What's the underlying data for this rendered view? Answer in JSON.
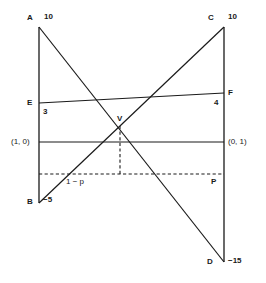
{
  "figure": {
    "type": "geometric-diagram",
    "canvas": {
      "width": 266,
      "height": 283
    },
    "colors": {
      "stroke": "#1a1a1a",
      "background": "#ffffff",
      "text": "#1a1a1a"
    }
  },
  "axes": {
    "left": {
      "x": 39,
      "y_top": 27,
      "y_bottom": 203
    },
    "right": {
      "x": 224,
      "y_top": 27,
      "y_bottom": 262
    }
  },
  "lines": [
    {
      "name": "left-axis",
      "style": "solid",
      "x1": 39,
      "y1": 27,
      "x2": 39,
      "y2": 203
    },
    {
      "name": "right-axis",
      "style": "solid",
      "x1": 224,
      "y1": 27,
      "x2": 224,
      "y2": 262
    },
    {
      "name": "diagonal-a-to-d",
      "style": "solid",
      "x1": 39,
      "y1": 27,
      "x2": 224,
      "y2": 262
    },
    {
      "name": "diagonal-b-to-c",
      "style": "solid",
      "x1": 39,
      "y1": 203,
      "x2": 224,
      "y2": 27
    },
    {
      "name": "line-e-to-f",
      "style": "solid",
      "x1": 39,
      "y1": 103,
      "x2": 224,
      "y2": 93
    },
    {
      "name": "horizontal-unit",
      "style": "solid",
      "x1": 39,
      "y1": 142,
      "x2": 224,
      "y2": 142
    },
    {
      "name": "probability-axis",
      "style": "dashed",
      "x1": 39,
      "y1": 174,
      "x2": 224,
      "y2": 174
    },
    {
      "name": "v-dropline",
      "style": "dashed",
      "x1": 120,
      "y1": 126,
      "x2": 120,
      "y2": 174
    }
  ],
  "points": {
    "A": {
      "label": "A",
      "value": "10",
      "x": 39,
      "y": 27
    },
    "B": {
      "label": "B",
      "value": "−5",
      "x": 39,
      "y": 203
    },
    "C": {
      "label": "C",
      "value": "10",
      "x": 224,
      "y": 27
    },
    "D": {
      "label": "D",
      "value": "−15",
      "x": 224,
      "y": 262
    },
    "E": {
      "label": "E",
      "value": "3",
      "x": 39,
      "y": 103
    },
    "F": {
      "label": "F",
      "value": "4",
      "x": 224,
      "y": 93
    },
    "V": {
      "label": "V",
      "value": "",
      "x": 120,
      "y": 126
    }
  },
  "labels": {
    "point_a": "A",
    "value_a": "10",
    "point_b": "B",
    "value_b": "−5",
    "point_c": "C",
    "value_c": "10",
    "point_d": "D",
    "value_d": "−15",
    "point_e": "E",
    "value_e": "3",
    "point_f": "F",
    "value_f": "4",
    "point_v": "V",
    "coord_left": "(1, 0)",
    "coord_right": "(0, 1)",
    "prob_left": "1 − p",
    "prob_right": "P"
  }
}
